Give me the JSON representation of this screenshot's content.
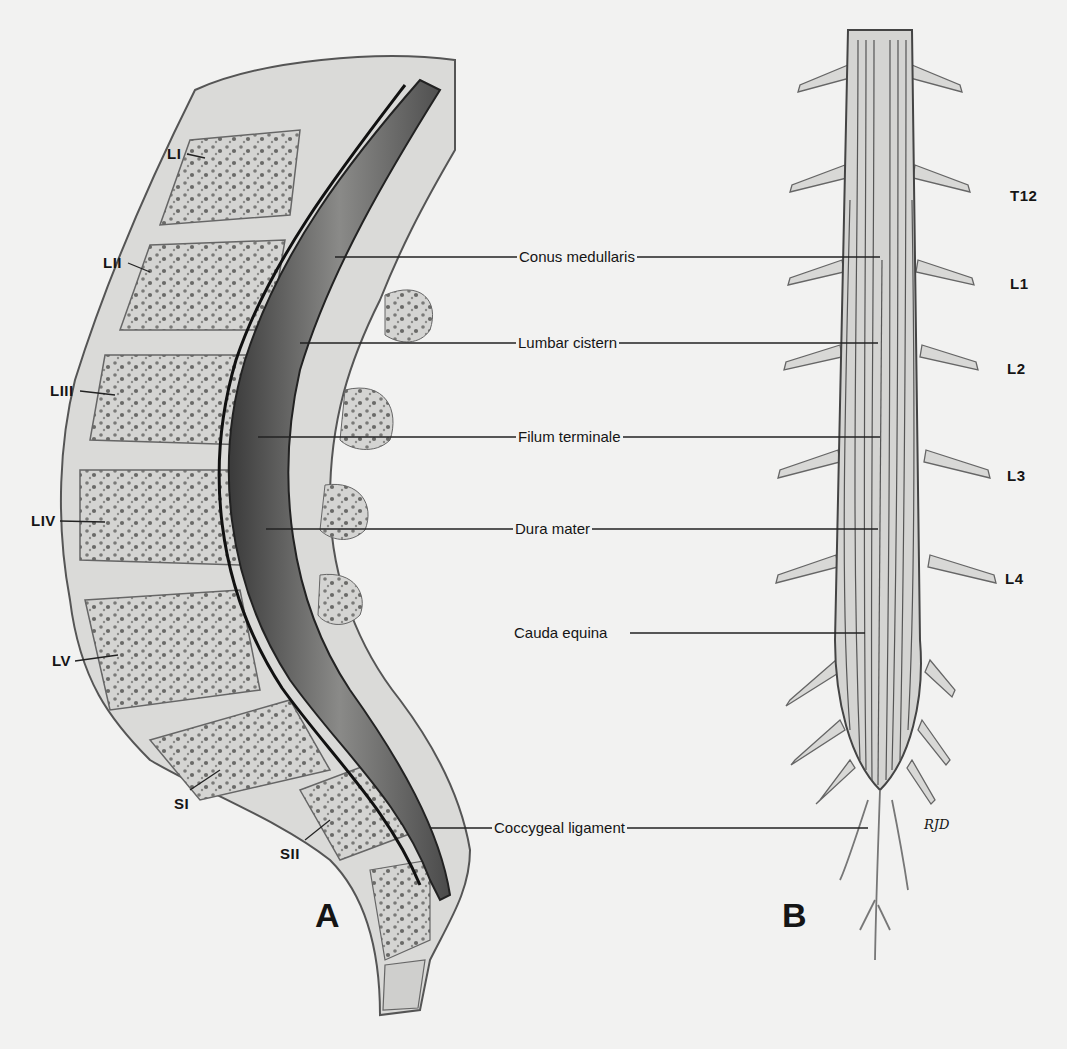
{
  "figure": {
    "panel_a": {
      "letter": "A",
      "vertebra_labels": [
        {
          "text": "LI",
          "x": 167,
          "y": 145
        },
        {
          "text": "LII",
          "x": 103,
          "y": 254
        },
        {
          "text": "LIII",
          "x": 50,
          "y": 382
        },
        {
          "text": "LIV",
          "x": 31,
          "y": 512
        },
        {
          "text": "LV",
          "x": 52,
          "y": 652
        },
        {
          "text": "SI",
          "x": 174,
          "y": 795
        },
        {
          "text": "SII",
          "x": 280,
          "y": 845
        }
      ]
    },
    "panel_b": {
      "letter": "B",
      "level_labels": [
        {
          "text": "T12",
          "x": 1010,
          "y": 187
        },
        {
          "text": "L1",
          "x": 1010,
          "y": 275
        },
        {
          "text": "L2",
          "x": 1007,
          "y": 360
        },
        {
          "text": "L3",
          "x": 1007,
          "y": 467
        },
        {
          "text": "L4",
          "x": 1005,
          "y": 570
        }
      ],
      "signature": "RJD"
    },
    "structure_labels": [
      {
        "text": "Conus medullaris",
        "x": 517,
        "y": 248,
        "line_left": 335,
        "line_right": 880
      },
      {
        "text": "Lumbar cistern",
        "x": 516,
        "y": 334,
        "line_left": 300,
        "line_right": 878
      },
      {
        "text": "Filum terminale",
        "x": 516,
        "y": 428,
        "line_left": 258,
        "line_right": 880
      },
      {
        "text": "Dura mater",
        "x": 513,
        "y": 520,
        "line_left": 266,
        "line_right": 878
      },
      {
        "text": "Cauda equina",
        "x": 512,
        "y": 624,
        "line_left": null,
        "line_right": 865
      },
      {
        "text": "Coccygeal ligament",
        "x": 492,
        "y": 819,
        "line_left": 430,
        "line_right": 868
      }
    ]
  },
  "colors": {
    "background": "#f2f2f1",
    "bone": "#d6d6d4",
    "bone_dark": "#9a9a98",
    "canal": "#5a5a58",
    "line": "#222222"
  }
}
